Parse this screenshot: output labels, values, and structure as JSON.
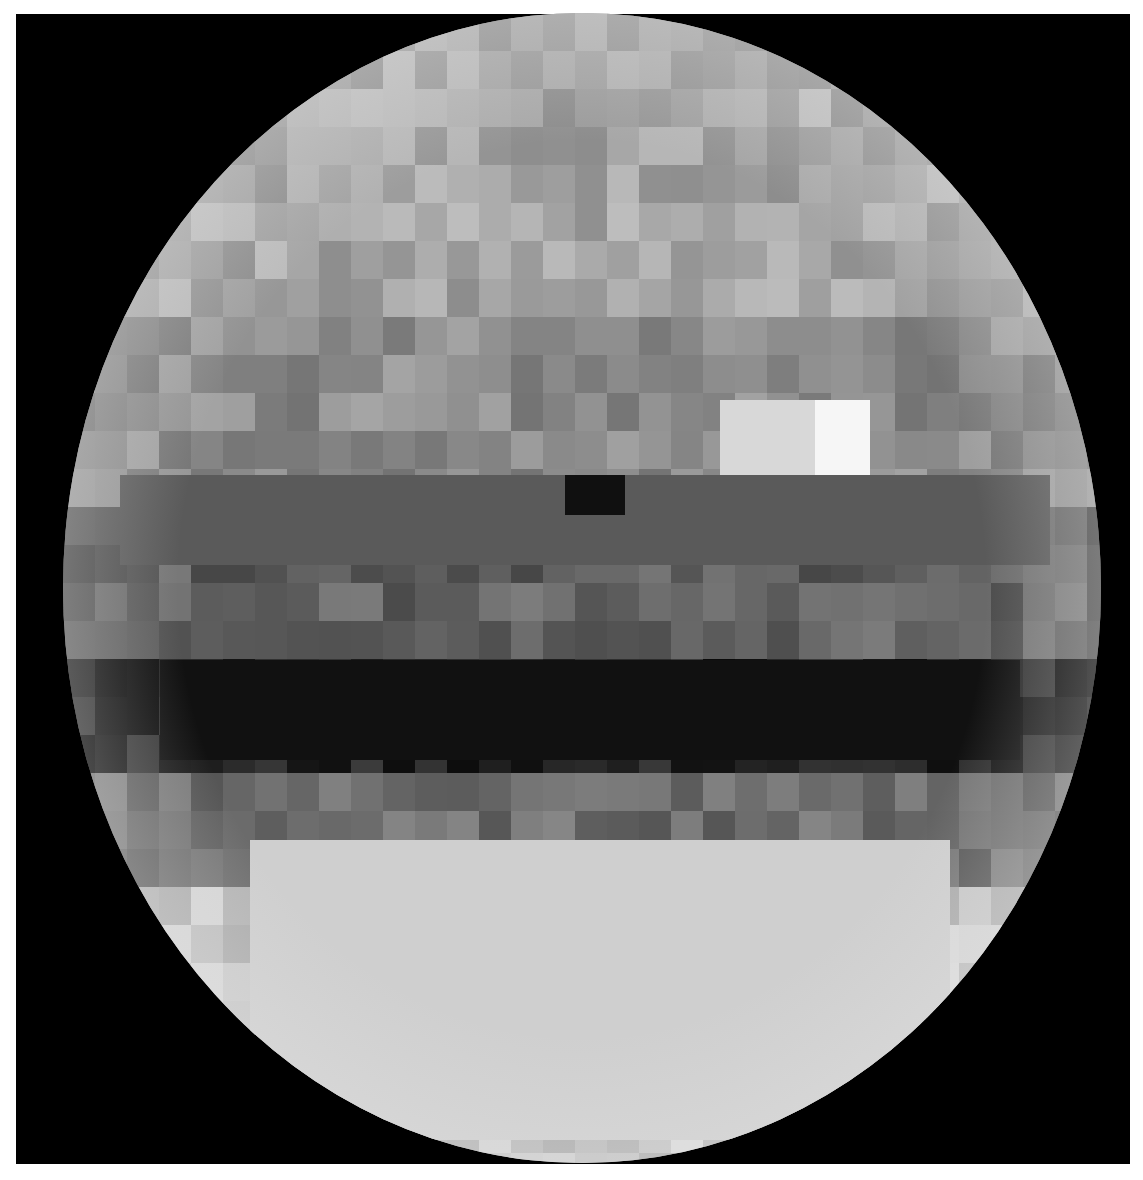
{
  "image": {
    "description": "Pixelated grayscale globe (planetary surface albedo map) on black background",
    "background_color": "#000000",
    "frame": {
      "left": 16,
      "top": 14,
      "width": 1114,
      "height": 1150
    },
    "sphere": {
      "center_x": 582,
      "center_y": 588,
      "radius_x": 519,
      "radius_y": 575
    },
    "limb_color": "#dcdcdc",
    "features": [
      {
        "name": "bright-spot-northeast",
        "x": 810,
        "y": 400,
        "w": 60,
        "h": 75,
        "color": "#f6f6f6"
      },
      {
        "name": "bright-region-east",
        "x": 720,
        "y": 400,
        "w": 95,
        "h": 75,
        "color": "#d8d8d8"
      },
      {
        "name": "dark-equatorial-band",
        "x": 160,
        "y": 660,
        "w": 860,
        "h": 100,
        "color": "#111111"
      },
      {
        "name": "dark-mid-band",
        "x": 120,
        "y": 475,
        "w": 930,
        "h": 90,
        "color": "#5a5a5a"
      },
      {
        "name": "darkest-center-patch",
        "x": 565,
        "y": 475,
        "w": 60,
        "h": 40,
        "color": "#101010"
      },
      {
        "name": "light-south-cap",
        "x": 250,
        "y": 840,
        "w": 700,
        "h": 300,
        "color": "#cfcfcf"
      }
    ]
  }
}
